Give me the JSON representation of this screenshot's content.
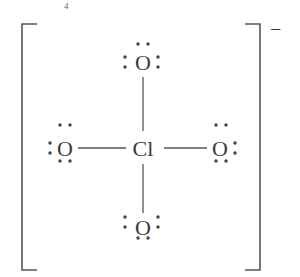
{
  "diagram": {
    "type": "lewis-structure",
    "species": "perchlorate ion",
    "fragment_label": "4",
    "charge": "−",
    "central_atom": {
      "symbol": "Cl"
    },
    "ligands": [
      {
        "position": "top",
        "symbol": "O",
        "bond": "single",
        "lone_pairs": 3
      },
      {
        "position": "left",
        "symbol": "O",
        "bond": "single",
        "lone_pairs": 3
      },
      {
        "position": "right",
        "symbol": "O",
        "bond": "single",
        "lone_pairs": 3
      },
      {
        "position": "bottom",
        "symbol": "O",
        "bond": "single",
        "lone_pairs": 3
      }
    ],
    "colors": {
      "ink": "#3a3a3a",
      "background": "#ffffff"
    }
  }
}
